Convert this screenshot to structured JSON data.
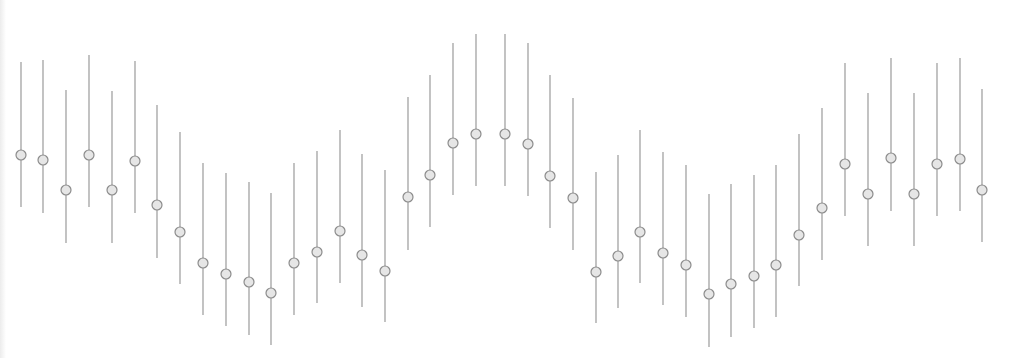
{
  "chart_data": {
    "type": "scatter",
    "subtype": "errorbar",
    "title": "",
    "xlabel": "",
    "ylabel": "",
    "grid": false,
    "axes_visible": false,
    "legend": null,
    "style": {
      "line_color": "#9a9a9a",
      "marker_stroke": "#8c8c8c",
      "marker_fill": "#e6e6e6",
      "marker_radius": 5,
      "background": "#ffffff"
    },
    "x": [
      21,
      43,
      66,
      89,
      112,
      135,
      157,
      180,
      203,
      226,
      249,
      271,
      294,
      317,
      340,
      362,
      385,
      408,
      430,
      453,
      476,
      505,
      528,
      550,
      573,
      596,
      618,
      640,
      663,
      686,
      709,
      731,
      754,
      776,
      799,
      822,
      845,
      868,
      891,
      914,
      937,
      960,
      982
    ],
    "center_y_px": [
      155,
      160,
      190,
      155,
      190,
      161,
      205,
      232,
      263,
      274,
      282,
      293,
      263,
      252,
      231,
      255,
      271,
      197,
      175,
      143,
      134,
      134,
      144,
      176,
      198,
      272,
      256,
      232,
      253,
      265,
      294,
      284,
      276,
      265,
      235,
      208,
      164,
      194,
      158,
      194,
      164,
      159,
      190
    ],
    "top_y_px": [
      62,
      60,
      90,
      55,
      91,
      61,
      105,
      132,
      163,
      173,
      182,
      193,
      163,
      151,
      130,
      154,
      170,
      97,
      75,
      43,
      34,
      34,
      43,
      75,
      98,
      172,
      155,
      130,
      152,
      165,
      194,
      184,
      175,
      165,
      134,
      108,
      63,
      93,
      58,
      93,
      63,
      58,
      89
    ],
    "bottom_y_px": [
      207,
      213,
      243,
      207,
      243,
      213,
      258,
      284,
      315,
      326,
      335,
      345,
      315,
      303,
      283,
      307,
      322,
      250,
      227,
      195,
      186,
      186,
      196,
      228,
      250,
      323,
      308,
      283,
      305,
      317,
      347,
      337,
      328,
      317,
      286,
      260,
      216,
      246,
      211,
      246,
      216,
      211,
      242
    ],
    "series": [
      {
        "name": "measurements",
        "values": [
          203,
          198,
          168,
          203,
          168,
          197,
          153,
          126,
          95,
          84,
          76,
          65,
          95,
          106,
          127,
          103,
          87,
          161,
          183,
          215,
          224,
          224,
          214,
          182,
          160,
          86,
          102,
          126,
          105,
          93,
          64,
          74,
          82,
          93,
          123,
          150,
          194,
          164,
          200,
          164,
          194,
          199,
          168
        ],
        "error": [
          73,
          77,
          77,
          76,
          76,
          76,
          77,
          76,
          76,
          77,
          77,
          76,
          76,
          76,
          77,
          77,
          76,
          77,
          76,
          76,
          76,
          76,
          77,
          77,
          76,
          76,
          77,
          77,
          77,
          76,
          77,
          77,
          77,
          76,
          76,
          76,
          77,
          77,
          77,
          77,
          77,
          77,
          77
        ]
      }
    ]
  }
}
